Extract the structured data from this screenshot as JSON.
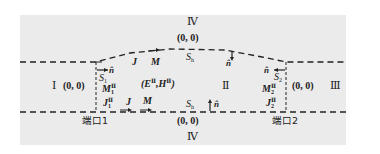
{
  "regions": {
    "region_1": "Ⅰ",
    "region_2": "Ⅱ",
    "region_3": "Ⅲ",
    "region_4_top": "Ⅳ",
    "region_4_bottom": "Ⅳ"
  },
  "coords": {
    "top": "(0, 0)",
    "bottom": "(0, 0)",
    "left": "(0, 0)",
    "right": "(0, 0)"
  },
  "fields": {
    "region_2_fields": "(E",
    "E_sup": "Ⅱ",
    "comma_H": ",H",
    "H_sup": "Ⅱ",
    "close": ")"
  },
  "surfaces": {
    "S1": "S",
    "S1_sub": "1",
    "S2": "S",
    "S2_sub": "2",
    "Sh_top": "S",
    "Sh_top_sub": "h",
    "Sh_bottom": "S",
    "Sh_bottom_sub": "h"
  },
  "currents": {
    "J_top": "J",
    "M_top": "M",
    "J_bottom": "J",
    "M_bottom": "M",
    "M1": "M",
    "M1_sub": "1",
    "M1_sup": "Ⅱ",
    "J1": "J",
    "J1_sub": "1",
    "J1_sup": "Ⅱ",
    "M2": "M",
    "M2_sub": "2",
    "M2_sup": "Ⅱ",
    "J2": "J",
    "J2_sub": "2",
    "J2_sup": "Ⅱ"
  },
  "normals": {
    "n_left": "n̂",
    "n_top": "n̂",
    "n_right": "n̂",
    "n_bottom": "n̂"
  },
  "ports": {
    "port_1": "端口1",
    "port_2": "端口2"
  },
  "colors": {
    "panel_bg": "#ebebeb",
    "line": "#222222"
  }
}
